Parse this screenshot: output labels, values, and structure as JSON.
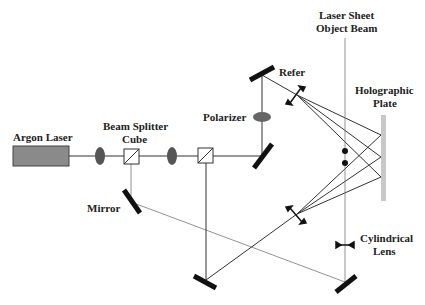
{
  "labels": {
    "argon_laser": "Argon Laser",
    "beam_splitter_line1": "Beam Splitter",
    "beam_splitter_line2": "Cube",
    "polarizer": "Polarizer",
    "refer": "Refer",
    "laser_sheet_line1": "Laser Sheet",
    "laser_sheet_line2": "Object Beam",
    "holographic_line1": "Holographic",
    "holographic_line2": "Plate",
    "mirror": "Mirror",
    "cylindrical_line1": "Cylindrical",
    "cylindrical_line2": "Lens"
  },
  "colors": {
    "laser_fill": "#8a8a8a",
    "lens_fill": "#555555",
    "plate_fill": "#c8c8c8",
    "mirror": "#111111",
    "beam": "#333333"
  }
}
